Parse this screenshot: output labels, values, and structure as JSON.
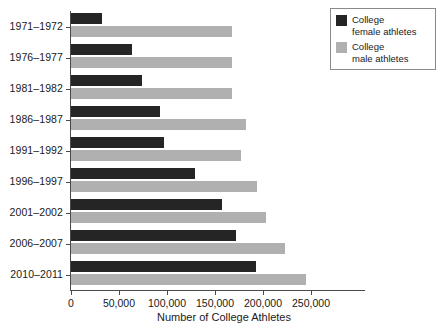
{
  "chart_data": {
    "type": "bar",
    "orientation": "horizontal",
    "title": "",
    "xlabel": "Number of College Athletes",
    "ylabel": "",
    "categories": [
      "1971–1972",
      "1976–1977",
      "1981–1982",
      "1986–1987",
      "1991–1992",
      "1996–1997",
      "2001–2002",
      "2006–2007",
      "2010–2011"
    ],
    "series": [
      {
        "name": "College female athletes",
        "color": "#252525",
        "values": [
          32000,
          64000,
          74000,
          93000,
          97000,
          129000,
          157000,
          172000,
          193000
        ]
      },
      {
        "name": "College male athletes",
        "color": "#b0b0b0",
        "values": [
          168000,
          168000,
          168000,
          182000,
          177000,
          194000,
          203000,
          223000,
          245000
        ]
      }
    ],
    "xlim": [
      0,
      260000
    ],
    "xticks": [
      0,
      50000,
      100000,
      150000,
      200000,
      250000
    ],
    "xtick_labels": [
      "0",
      "50,000",
      "100,000",
      "150,000",
      "200,000",
      "250,000"
    ],
    "grid": false,
    "legend_position": "top-right"
  },
  "legend": {
    "entries": [
      {
        "line1": "College",
        "line2": "female athletes",
        "color": "#252525",
        "swatch_name": "legend-swatch-female"
      },
      {
        "line1": "College",
        "line2": "male athletes",
        "color": "#b0b0b0",
        "swatch_name": "legend-swatch-male"
      }
    ]
  }
}
